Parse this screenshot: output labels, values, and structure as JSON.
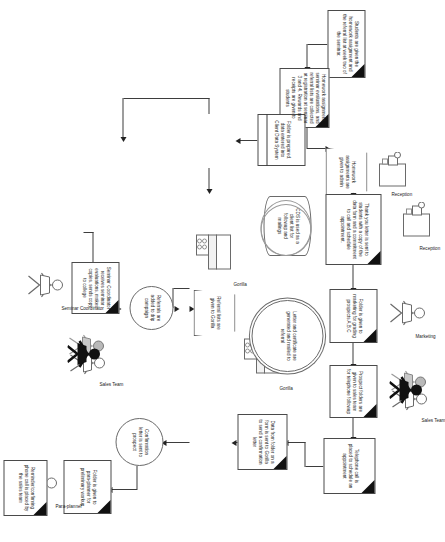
{
  "diagram": {
    "orientation_deg": 90,
    "nodes": [
      {
        "id": "n1",
        "shape": "document",
        "text": "Students are given the homework assignment and the referral list at week two of the seminar."
      },
      {
        "id": "n2",
        "shape": "document",
        "text": "Homework assignment, seminar evaluations, and referral lists are collected at registration at seminar 3 and 4.  Rewards and receipts are given to students"
      },
      {
        "id": "n3",
        "shape": "trapezoid",
        "text": "Homework assignments are given to admin"
      },
      {
        "id": "n4",
        "shape": "process",
        "text": "Folder is prepared, data entered into Client Data System"
      },
      {
        "id": "n5",
        "shape": "database",
        "text": "CDS is used as a client list for followup and mailings"
      },
      {
        "id": "n6",
        "shape": "document",
        "text": "Thank you letter is sent to students with a copy of the data form and a commitment to call and schedule appointment."
      },
      {
        "id": "n7",
        "shape": "document",
        "text": "Folder is given to marketing for grading prospects A,B,C"
      },
      {
        "id": "n8",
        "shape": "document",
        "text": "Prospect folders are given to sales team for telephone followup"
      },
      {
        "id": "n9",
        "shape": "document",
        "text": "Telephone call is placed to schedule an appointment"
      },
      {
        "id": "n10",
        "shape": "document",
        "text": "Data from folder on a form is sent to Gorilla to send a confirmation letter"
      },
      {
        "id": "n11",
        "shape": "circle",
        "text": "Confirmation letter is sent to prospect"
      },
      {
        "id": "n12",
        "shape": "document",
        "text": "Folder is given to para-planner for preliminary workup"
      },
      {
        "id": "n13",
        "shape": "document",
        "text": "Reminder/confirming phone call is placed by the sales team"
      },
      {
        "id": "n14",
        "shape": "trapezoid",
        "text": "Referral lists are given to Gorilla"
      },
      {
        "id": "n15",
        "shape": "circle",
        "text": "Referrals are added to drip campaign"
      },
      {
        "id": "n16",
        "shape": "circle-double",
        "text": "Letter and certificate are generated and mailed to referral"
      },
      {
        "id": "n17",
        "shape": "document",
        "text": "Seminar Coordinator receives seminar evaluations, makes copies, sends copy to college"
      }
    ],
    "actors": [
      {
        "id": "a1",
        "icon": "reception-desk-icon",
        "label": "Reception"
      },
      {
        "id": "a2",
        "icon": "reception-desk-icon",
        "label": "Reception"
      },
      {
        "id": "a3",
        "icon": "person-icon",
        "label": "Marketing"
      },
      {
        "id": "a4",
        "icon": "people-group-icon",
        "label": "Sales Team"
      },
      {
        "id": "a5",
        "icon": "people-group-icon",
        "label": "Sales Team"
      },
      {
        "id": "a6",
        "icon": "computer-icon",
        "label": "Gorilla"
      },
      {
        "id": "a7",
        "icon": "computer-icon",
        "label": "Gorilla"
      },
      {
        "id": "a8",
        "icon": "person-icon",
        "label": "Para-planner"
      },
      {
        "id": "a9",
        "icon": "person-icon",
        "label": "Seminar Coordinator"
      }
    ],
    "colors": {
      "background": "#ffffff",
      "stroke": "#4a4a4a",
      "text": "#1c1c1c",
      "fold": "#111111",
      "arrow": "#222222"
    }
  }
}
